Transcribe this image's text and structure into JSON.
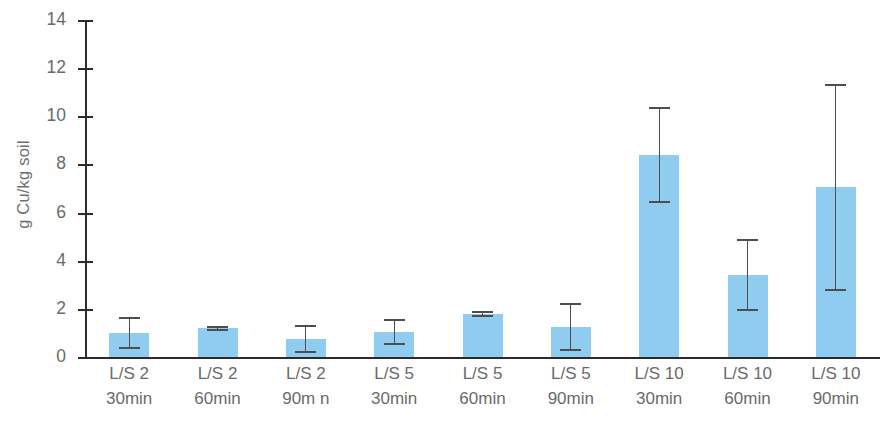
{
  "chart_data": {
    "type": "bar",
    "title": "",
    "xlabel": "",
    "ylabel": "g Cu/kg soil",
    "ylim": [
      0,
      14
    ],
    "yticks": [
      0,
      2,
      4,
      6,
      8,
      10,
      12,
      14
    ],
    "ytick_labels": [
      "0",
      "2",
      "4",
      "6",
      "8",
      "10",
      "12",
      "14"
    ],
    "grid": false,
    "legend": null,
    "bar_color": "#8fccef",
    "error_color": "#4e4e4e",
    "axis_color": "#2b2b2b",
    "text_color": "#6a6a6a",
    "categories": [
      "L/S 2 30min",
      "L/S 2 60min",
      "L/S 2 90min",
      "L/S 5 30min",
      "L/S 5 60min",
      "L/S 5 90min",
      "L/S 10 30min",
      "L/S 10 60min",
      "L/S 10 90min"
    ],
    "category_lines": [
      {
        "line1": "L/S 2",
        "line2": "30min"
      },
      {
        "line1": "L/S 2",
        "line2": "60min"
      },
      {
        "line1": "L/S 2",
        "line2": "90m n"
      },
      {
        "line1": "L/S 5",
        "line2": "30min"
      },
      {
        "line1": "L/S 5",
        "line2": "60min"
      },
      {
        "line1": "L/S 5",
        "line2": "90min"
      },
      {
        "line1": "L/S 10",
        "line2": "30min"
      },
      {
        "line1": "L/S 10",
        "line2": "60min"
      },
      {
        "line1": "L/S 10",
        "line2": "90min"
      }
    ],
    "values": [
      1.0,
      1.2,
      0.75,
      1.05,
      1.8,
      1.25,
      8.4,
      3.4,
      7.05
    ],
    "errors": [
      0.65,
      0.1,
      0.6,
      0.55,
      0.12,
      1.0,
      2.0,
      1.5,
      4.3
    ],
    "series": [
      {
        "name": "Cu extracted",
        "values": [
          1.0,
          1.2,
          0.75,
          1.05,
          1.8,
          1.25,
          8.4,
          3.4,
          7.05
        ],
        "errors": [
          0.65,
          0.1,
          0.6,
          0.55,
          0.12,
          1.0,
          2.0,
          1.5,
          4.3
        ]
      }
    ]
  }
}
